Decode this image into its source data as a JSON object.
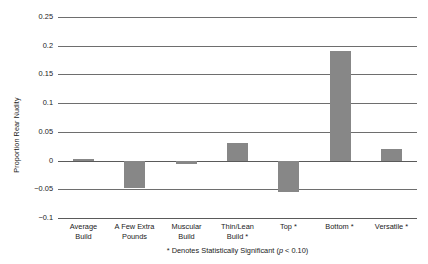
{
  "chart_data": {
    "type": "bar",
    "title": "",
    "xlabel": "",
    "ylabel": "Proportion Rear Nudity",
    "categories": [
      "Average\nBuild",
      "A Few Extra\nPounds",
      "Muscular\nBuild",
      "Thin/Lean\nBuild *",
      "Top *",
      "Bottom *",
      "Versatile *"
    ],
    "values": [
      0.002,
      -0.048,
      -0.006,
      0.031,
      -0.055,
      0.19,
      0.02
    ],
    "ylim": [
      -0.1,
      0.25
    ],
    "yticks": [
      0.25,
      0.2,
      0.15,
      0.1,
      0.05,
      0,
      -0.05,
      -0.1
    ],
    "ytick_labels": [
      "0.25",
      "0.2",
      "0.15",
      "0.1",
      "0.05",
      "0",
      "−0.05",
      "−0.1"
    ],
    "grid": true,
    "legend": "none",
    "bar_color": "#878787",
    "annotation": "* Denotes Statistically Significant (p < 0.10)",
    "annotation_prefix": "* Denotes Statistically Significant (",
    "annotation_italic": "p",
    "annotation_suffix": " < 0.10)"
  }
}
